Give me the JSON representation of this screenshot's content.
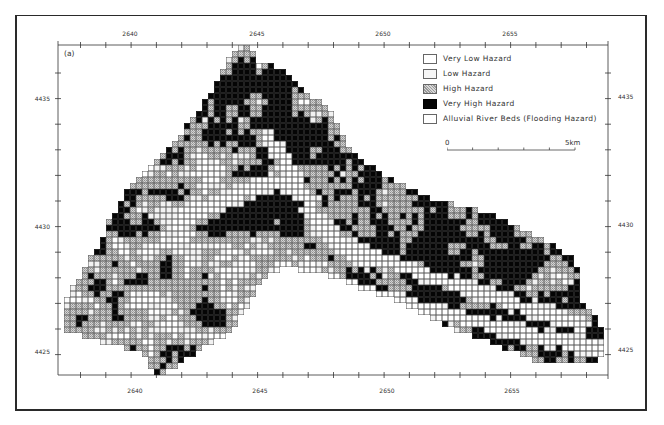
{
  "figure": {
    "panel_label": "(a)",
    "axes": {
      "x_ticks_top": [
        {
          "label": "2640",
          "x": 130
        },
        {
          "label": "2645",
          "x": 257
        },
        {
          "label": "2650",
          "x": 383
        },
        {
          "label": "2655",
          "x": 510
        }
      ],
      "x_ticks_bottom": [
        {
          "label": "2640",
          "x": 135
        },
        {
          "label": "2645",
          "x": 260
        },
        {
          "label": "2650",
          "x": 387
        },
        {
          "label": "2655",
          "x": 512
        }
      ],
      "y_ticks_left": [
        {
          "label": "4435",
          "y": 99
        },
        {
          "label": "4430",
          "y": 227
        },
        {
          "label": "4425",
          "y": 352
        }
      ],
      "y_ticks_right": [
        {
          "label": "4435",
          "y": 97
        },
        {
          "label": "4430",
          "y": 225
        },
        {
          "label": "4425",
          "y": 350
        }
      ]
    },
    "legend": {
      "items": [
        {
          "label": "Very Low Hazard",
          "class": "vlow",
          "color": "#ffffff"
        },
        {
          "label": "Low Hazard",
          "class": "low",
          "color": "#f6f6f6"
        },
        {
          "label": "High Hazard",
          "class": "high",
          "color": "#b8b8b8"
        },
        {
          "label": "Very High Hazard",
          "class": "vhigh",
          "color": "#050505"
        },
        {
          "label": "Alluvial River Beds (Flooding Hazard)",
          "class": "flood",
          "color": "#ffffff"
        }
      ]
    },
    "scale_bar": {
      "start_label": "0",
      "end_label": "5km",
      "divisions": 5
    }
  }
}
